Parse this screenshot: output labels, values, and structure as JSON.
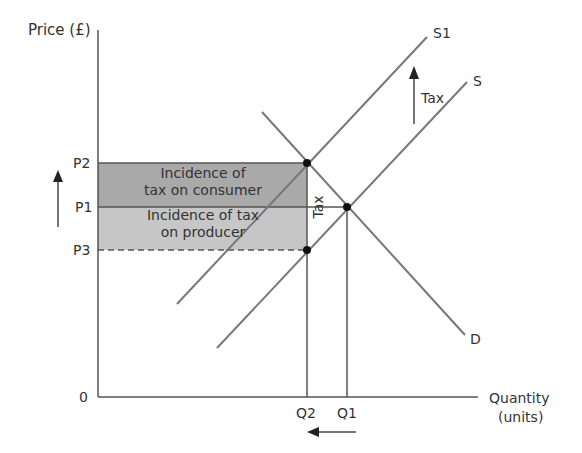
{
  "diagram": {
    "y_axis_label": "Price (£)",
    "x_axis_label_line1": "Quantity",
    "x_axis_label_line2": "(units)",
    "origin_label": "0",
    "price_labels": {
      "p2": "P2",
      "p1": "P1",
      "p3": "P3"
    },
    "quantity_labels": {
      "q2": "Q2",
      "q1": "Q1"
    },
    "curves": {
      "s1": "S1",
      "s": "S",
      "d": "D"
    },
    "tax_shift_label": "Tax",
    "tax_vertical_label": "Tax",
    "consumer_area_line1": "Incidence of",
    "consumer_area_line2": "tax on consumer",
    "producer_area_line1": "Incidence of tax",
    "producer_area_line2": "on producer",
    "colors": {
      "line": "#555555",
      "consumer_area": "#a9a9a9",
      "producer_area": "#c6c6c6",
      "point": "#111111"
    }
  }
}
